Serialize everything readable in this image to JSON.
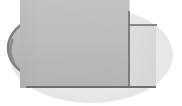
{
  "canvas": {
    "width": 182,
    "height": 106,
    "background_color": "#ffffff",
    "title": "Shaded elliptical solid with rectangular notch"
  },
  "palette": {
    "background": "#ffffff",
    "light_ellipse_fill": "#e9e9e9",
    "light_ellipse_fill_alt": "#ededed",
    "body_fill_light": "#bdbdbd",
    "body_fill_dark": "#a9a9a9",
    "body_fill_mid": "#b2b2b2",
    "edge_dark": "#6f6f6f",
    "edge_darker": "#5e5e5e",
    "edge_soft": "#8c8c8c",
    "notch_fill": "#d8d8d8"
  },
  "shapes": [
    {
      "id": "backdrop-ellipse",
      "name": "light-ellipse-backdrop",
      "type": "ellipse",
      "cx": 91,
      "cy": 55,
      "rx": 82,
      "ry": 48,
      "fill": "#e9e9e9",
      "stroke": "none"
    },
    {
      "id": "main-body",
      "name": "gray-elliptical-body",
      "type": "clipped-ellipse",
      "cx": 74,
      "cy": 48,
      "rx": 66,
      "ry": 39,
      "clip_right_x": 129,
      "clip_bottom_y": 88,
      "fill_top": "#c2c2c2",
      "fill_bottom": "#a6a6a6",
      "stroke": "none"
    },
    {
      "id": "notch-panel",
      "name": "rectangular-notch-panel",
      "type": "rect",
      "x": 129,
      "y": 25,
      "width": 27,
      "height": 62,
      "fill": "#dcdcdc",
      "stroke": "none"
    },
    {
      "id": "vertical-edge",
      "name": "vertical-edge-line",
      "type": "line",
      "x1": 129,
      "y1": 11,
      "x2": 129,
      "y2": 88,
      "stroke": "#6f6f6f",
      "stroke_width": 1.6
    },
    {
      "id": "top-notch-edge",
      "name": "top-horizontal-edge-line",
      "type": "line",
      "x1": 129,
      "y1": 25,
      "x2": 157,
      "y2": 25,
      "stroke": "#6f6f6f",
      "stroke_width": 1.6
    },
    {
      "id": "bottom-edge",
      "name": "bottom-horizontal-edge-line",
      "type": "line",
      "x1": 26,
      "y1": 87,
      "x2": 156,
      "y2": 87,
      "stroke": "#6f6f6f",
      "stroke_width": 1.8
    },
    {
      "id": "left-edge",
      "name": "left-curved-edge-shadow",
      "type": "arc",
      "stroke": "#7a7a7a",
      "stroke_width": 2.2,
      "description": "dark vertical sliver along left rounded side of body"
    }
  ],
  "annotations": {
    "labels": [],
    "dimensions": [],
    "legend": []
  },
  "measurements": {
    "body_left_x": 10,
    "body_right_x": 129,
    "body_top_y": 11,
    "body_bottom_y": 88,
    "notch_right_x": 157,
    "notch_top_y": 25,
    "backdrop_left_x": 9,
    "backdrop_right_x": 173,
    "backdrop_top_y": 7,
    "backdrop_bottom_y": 103
  }
}
